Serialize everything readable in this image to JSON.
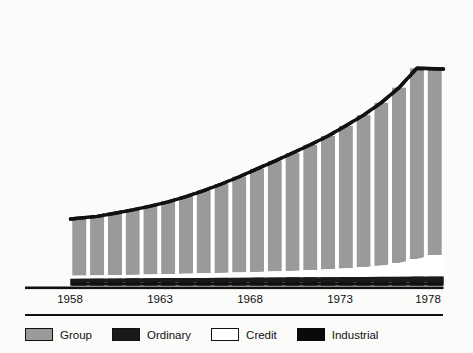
{
  "chart_data": {
    "type": "area",
    "title": "",
    "subtitle": "",
    "xlabel": "",
    "ylabel": "12,000 dollars",
    "unit_label": "dollars",
    "grid": false,
    "legend_position": "bottom",
    "x": [
      1958,
      1959,
      1960,
      1961,
      1962,
      1963,
      1964,
      1965,
      1966,
      1967,
      1968,
      1969,
      1970,
      1971,
      1972,
      1973,
      1974,
      1975,
      1976,
      1977,
      1978
    ],
    "categories": [
      "1958",
      "1959",
      "1960",
      "1961",
      "1962",
      "1963",
      "1964",
      "1965",
      "1966",
      "1967",
      "1968",
      "1969",
      "1970",
      "1971",
      "1972",
      "1973",
      "1974",
      "1975",
      "1976",
      "1977",
      "1978"
    ],
    "xticks": [
      "1958",
      "1963",
      "1968",
      "1973",
      "1978"
    ],
    "xtick_values": [
      1958,
      1963,
      1968,
      1973,
      1978
    ],
    "yticks": [
      "0",
      "3,000",
      "6,000",
      "9,000",
      "12,000"
    ],
    "ytick_values": [
      0,
      3000,
      6000,
      9000,
      12000
    ],
    "ylim": [
      0,
      12000
    ],
    "xlim": [
      1958,
      1978
    ],
    "stacked": true,
    "series": [
      {
        "name": "Industrial",
        "color": "#111111",
        "values": [
          150,
          150,
          150,
          150,
          150,
          150,
          150,
          150,
          150,
          150,
          150,
          150,
          150,
          150,
          150,
          150,
          150,
          150,
          150,
          150,
          150
        ]
      },
      {
        "name": "Ordinary",
        "color": "#1a1a1a",
        "values": [
          170,
          175,
          180,
          185,
          190,
          195,
          200,
          205,
          210,
          215,
          220,
          225,
          230,
          235,
          240,
          245,
          250,
          255,
          260,
          265,
          270
        ]
      },
      {
        "name": "Credit",
        "color": "#ffffff",
        "values": [
          130,
          140,
          150,
          160,
          170,
          180,
          195,
          210,
          225,
          240,
          260,
          280,
          300,
          330,
          360,
          400,
          450,
          520,
          640,
          820,
          1000
        ]
      },
      {
        "name": "Group",
        "color": "#9a9a9a",
        "values": [
          2650,
          2760,
          2890,
          3030,
          3190,
          3380,
          3600,
          3860,
          4150,
          4470,
          4810,
          5150,
          5500,
          5850,
          6230,
          6650,
          7100,
          7600,
          8180,
          8900,
          8680
        ]
      }
    ],
    "totals": [
      3100,
      3225,
      3370,
      3525,
      3700,
      3905,
      4145,
      4425,
      4735,
      5075,
      5440,
      5805,
      6180,
      6565,
      6980,
      7450,
      7950,
      8530,
      9230,
      10135,
      10100
    ],
    "annotations": []
  },
  "legend": {
    "items": [
      {
        "label": "Group",
        "swatch": "gray-swatch",
        "color": "#9a9a9a"
      },
      {
        "label": "Ordinary",
        "swatch": "black-swatch",
        "color": "#1a1a1a"
      },
      {
        "label": "Credit",
        "swatch": "white-swatch",
        "color": "#ffffff"
      },
      {
        "label": "Industrial",
        "swatch": "solid-black-swatch",
        "color": "#0a0a0a"
      }
    ]
  },
  "axis": {
    "y_top_label_number": "12,000",
    "y_top_label_unit": "dollars",
    "y_labels": [
      "12,000",
      "9,000",
      "6,000",
      "3,000",
      "0"
    ],
    "x_labels": [
      "1958",
      "1963",
      "1968",
      "1973",
      "1978"
    ]
  },
  "colors": {
    "background": "#fbfbfa",
    "group": "#9a9a9a",
    "ordinary": "#1a1a1a",
    "credit": "#ffffff",
    "industrial": "#0a0a0a",
    "axis": "#111111",
    "gap": "#fbfbfa"
  }
}
